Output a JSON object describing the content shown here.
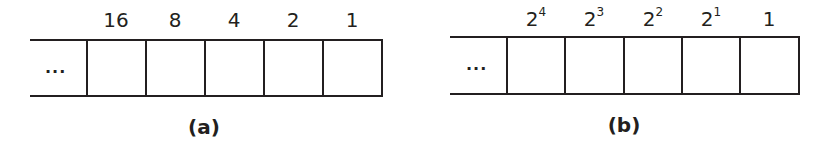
{
  "panels": [
    {
      "id": "a",
      "caption": "(a)",
      "ellipsis": "...",
      "labels": [
        {
          "base": "16",
          "exp": ""
        },
        {
          "base": "8",
          "exp": ""
        },
        {
          "base": "4",
          "exp": ""
        },
        {
          "base": "2",
          "exp": ""
        },
        {
          "base": "1",
          "exp": ""
        }
      ]
    },
    {
      "id": "b",
      "caption": "(b)",
      "ellipsis": "...",
      "labels": [
        {
          "base": "2",
          "exp": "4"
        },
        {
          "base": "2",
          "exp": "3"
        },
        {
          "base": "2",
          "exp": "2"
        },
        {
          "base": "2",
          "exp": "1"
        },
        {
          "base": "1",
          "exp": ""
        }
      ]
    }
  ],
  "colors": {
    "stroke": "#231f20",
    "background": "#ffffff"
  }
}
